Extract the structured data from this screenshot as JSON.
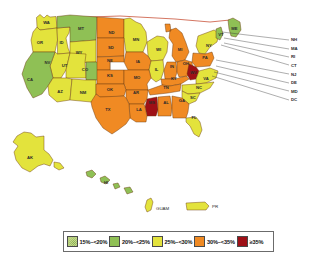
{
  "map": {
    "title": "Obesity Prevalence by State and Territory",
    "colors": {
      "c1": "#c5d98a",
      "c2": "#8fc055",
      "c3": "#e3e33c",
      "c4": "#f08a23",
      "c5": "#9e1016",
      "border": "#6b3a10",
      "background": "#ffffff",
      "label_text": "#2b2b2b"
    },
    "states": [
      {
        "code": "WA",
        "bin": "c3",
        "x": 46.5,
        "y": 22.5
      },
      {
        "code": "OR",
        "bin": "c3",
        "x": 40.0,
        "y": 42.5
      },
      {
        "code": "ID",
        "bin": "c3",
        "x": 61.5,
        "y": 42.5
      },
      {
        "code": "MT",
        "bin": "c2",
        "x": 81.0,
        "y": 29.0
      },
      {
        "code": "ND",
        "bin": "c4",
        "x": 111.5,
        "y": 33.0
      },
      {
        "code": "MN",
        "bin": "c3",
        "x": 136.0,
        "y": 40.0
      },
      {
        "code": "WI",
        "bin": "c3",
        "x": 158.5,
        "y": 50.0
      },
      {
        "code": "MI",
        "bin": "c4",
        "x": 180.0,
        "y": 50.0
      },
      {
        "code": "NY",
        "bin": "c3",
        "x": 209.0,
        "y": 46.0
      },
      {
        "code": "VT",
        "bin": "c2",
        "x": 221.0,
        "y": 34.5
      },
      {
        "code": "ME",
        "bin": "c2",
        "x": 234.5,
        "y": 29.0
      },
      {
        "code": "WY",
        "bin": "c3",
        "x": 79.0,
        "y": 52.5
      },
      {
        "code": "SD",
        "bin": "c4",
        "x": 111.0,
        "y": 48.0
      },
      {
        "code": "IA",
        "bin": "c4",
        "x": 138.0,
        "y": 62.0
      },
      {
        "code": "IL",
        "bin": "c3",
        "x": 156.5,
        "y": 70.0
      },
      {
        "code": "IN",
        "bin": "c4",
        "x": 172.0,
        "y": 67.0
      },
      {
        "code": "OH",
        "bin": "c4",
        "x": 186.0,
        "y": 64.0
      },
      {
        "code": "PA",
        "bin": "c4",
        "x": 205.0,
        "y": 58.0
      },
      {
        "code": "NV",
        "bin": "c3",
        "x": 47.5,
        "y": 63.0
      },
      {
        "code": "UT",
        "bin": "c3",
        "x": 64.5,
        "y": 66.0
      },
      {
        "code": "CO",
        "bin": "c2",
        "x": 85.0,
        "y": 70.0
      },
      {
        "code": "NE",
        "bin": "c4",
        "x": 110.0,
        "y": 61.0
      },
      {
        "code": "KS",
        "bin": "c4",
        "x": 110.0,
        "y": 76.0
      },
      {
        "code": "MO",
        "bin": "c4",
        "x": 137.0,
        "y": 78.0
      },
      {
        "code": "KY",
        "bin": "c4",
        "x": 174.0,
        "y": 79.0
      },
      {
        "code": "WV",
        "bin": "c5",
        "x": 193.5,
        "y": 73.0
      },
      {
        "code": "VA",
        "bin": "c3",
        "x": 206.0,
        "y": 79.0
      },
      {
        "code": "CA",
        "bin": "c2",
        "x": 30.0,
        "y": 80.0
      },
      {
        "code": "AZ",
        "bin": "c3",
        "x": 60.0,
        "y": 92.0
      },
      {
        "code": "NM",
        "bin": "c3",
        "x": 83.0,
        "y": 93.0
      },
      {
        "code": "OK",
        "bin": "c4",
        "x": 110.0,
        "y": 89.5
      },
      {
        "code": "AR",
        "bin": "c4",
        "x": 136.0,
        "y": 93.0
      },
      {
        "code": "TN",
        "bin": "c4",
        "x": 166.0,
        "y": 87.5
      },
      {
        "code": "NC",
        "bin": "c3",
        "x": 199.0,
        "y": 88.0
      },
      {
        "code": "SC",
        "bin": "c3",
        "x": 193.0,
        "y": 98.0
      },
      {
        "code": "MS",
        "bin": "c5",
        "x": 152.0,
        "y": 103.0
      },
      {
        "code": "AL",
        "bin": "c4",
        "x": 166.0,
        "y": 103.0
      },
      {
        "code": "GA",
        "bin": "c4",
        "x": 182.0,
        "y": 101.0
      },
      {
        "code": "LA",
        "bin": "c4",
        "x": 139.0,
        "y": 110.0
      },
      {
        "code": "TX",
        "bin": "c4",
        "x": 108.0,
        "y": 110.0
      },
      {
        "code": "FL",
        "bin": "c3",
        "x": 194.0,
        "y": 118.0
      },
      {
        "code": "AK",
        "bin": "c3",
        "x": 30.0,
        "y": 158.0
      },
      {
        "code": "HI",
        "bin": "c2",
        "x": 106.0,
        "y": 183.0
      }
    ],
    "callouts": [
      {
        "code": "NH",
        "bin": "c2"
      },
      {
        "code": "MA",
        "bin": "c2"
      },
      {
        "code": "RI",
        "bin": "c2"
      },
      {
        "code": "CT",
        "bin": "c2"
      },
      {
        "code": "NJ",
        "bin": "c3"
      },
      {
        "code": "DE",
        "bin": "c3"
      },
      {
        "code": "MD",
        "bin": "c3"
      },
      {
        "code": "DC",
        "bin": "c3"
      }
    ],
    "territories": [
      {
        "code": "GUAM",
        "bin": "c3"
      },
      {
        "code": "PR",
        "bin": "c3"
      }
    ]
  },
  "legend": {
    "items": [
      {
        "label": "15%–<20%",
        "bin": "c1",
        "pattern": true
      },
      {
        "label": "20%–<25%",
        "bin": "c2",
        "pattern": false
      },
      {
        "label": "25%–<30%",
        "bin": "c3",
        "pattern": false
      },
      {
        "label": "30%–<35%",
        "bin": "c4",
        "pattern": false
      },
      {
        "label": "≥35%",
        "bin": "c5",
        "pattern": false
      }
    ]
  }
}
